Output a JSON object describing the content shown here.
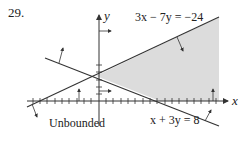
{
  "problem": {
    "number": "29."
  },
  "axes": {
    "x_label": "x",
    "y_label": "y"
  },
  "lines": [
    {
      "id": "line1",
      "equation": "3x − 7y = −24"
    },
    {
      "id": "line2",
      "equation": "x + 3y = 8"
    }
  ],
  "region": {
    "label": "Unbounded",
    "shade_color": "#d9d9d9"
  },
  "colors": {
    "line": "#333333",
    "shade": "#dcdcdc",
    "axis": "#333333"
  }
}
